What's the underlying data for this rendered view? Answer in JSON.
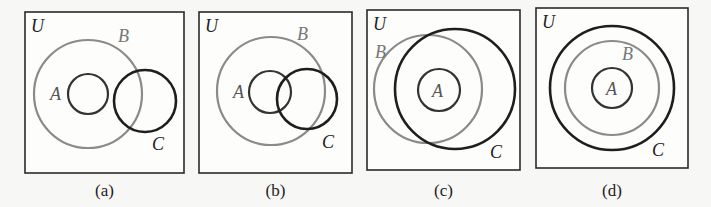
{
  "figure": {
    "background": "#f7f7f5",
    "colors": {
      "universe_box": "#2a2a2a",
      "gray_circle": "#8a8a8a",
      "dark_circle": "#1e1e1e",
      "label_dark": "#222222",
      "label_gray": "#777777"
    },
    "panels": [
      {
        "id": "a",
        "caption": "(a)",
        "universe": {
          "label": "U",
          "x": 25,
          "y": 12,
          "w": 159,
          "h": 161
        },
        "circles": [
          {
            "set": "B",
            "cx": 88,
            "cy": 94,
            "r": 54,
            "style": "gray",
            "label": "B",
            "lx": 118,
            "ly": 42
          },
          {
            "set": "A",
            "cx": 88,
            "cy": 94,
            "r": 20,
            "style": "dark-thin",
            "label": "A",
            "lx": 50,
            "ly": 100
          },
          {
            "set": "C",
            "cx": 145,
            "cy": 101,
            "r": 31,
            "style": "dark",
            "label": "C",
            "lx": 152,
            "ly": 150
          }
        ]
      },
      {
        "id": "b",
        "caption": "(b)",
        "universe": {
          "label": "U",
          "x": 199,
          "y": 12,
          "w": 153,
          "h": 161
        },
        "circles": [
          {
            "set": "B",
            "cx": 271,
            "cy": 91,
            "r": 54,
            "style": "gray",
            "label": "B",
            "lx": 297,
            "ly": 40
          },
          {
            "set": "A",
            "cx": 270,
            "cy": 92,
            "r": 21,
            "style": "dark-thin",
            "label": "A",
            "lx": 233,
            "ly": 98
          },
          {
            "set": "C",
            "cx": 307,
            "cy": 99,
            "r": 30,
            "style": "dark",
            "label": "C",
            "lx": 322,
            "ly": 148
          }
        ]
      },
      {
        "id": "c",
        "caption": "(c)",
        "universe": {
          "label": "U",
          "x": 367,
          "y": 10,
          "w": 153,
          "h": 160
        },
        "circles": [
          {
            "set": "B",
            "cx": 428,
            "cy": 89,
            "r": 54,
            "style": "gray",
            "label": "B",
            "lx": 375,
            "ly": 58
          },
          {
            "set": "C",
            "cx": 455,
            "cy": 89,
            "r": 60,
            "style": "dark",
            "label": "C",
            "lx": 490,
            "ly": 158
          },
          {
            "set": "A",
            "cx": 439,
            "cy": 90,
            "r": 21,
            "style": "dark-thin",
            "label": "A",
            "lx": 432,
            "ly": 97
          }
        ]
      },
      {
        "id": "d",
        "caption": "(d)",
        "universe": {
          "label": "U",
          "x": 536,
          "y": 8,
          "w": 152,
          "h": 160
        },
        "circles": [
          {
            "set": "C",
            "cx": 612,
            "cy": 88,
            "r": 62,
            "style": "dark",
            "label": "C",
            "lx": 652,
            "ly": 156
          },
          {
            "set": "B",
            "cx": 612,
            "cy": 88,
            "r": 47,
            "style": "gray",
            "label": "B",
            "lx": 622,
            "ly": 60
          },
          {
            "set": "A",
            "cx": 612,
            "cy": 88,
            "r": 20,
            "style": "dark-thin",
            "label": "A",
            "lx": 606,
            "ly": 95
          }
        ]
      }
    ]
  }
}
